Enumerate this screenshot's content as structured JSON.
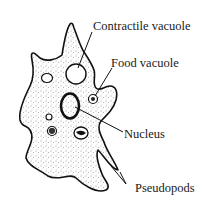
{
  "diagram": {
    "labels": {
      "contractile_vacuole": "Contractile vacuole",
      "food_vacuole": "Food vacuole",
      "nucleus": "Nucleus",
      "pseudopods": "Pseudopods"
    },
    "colors": {
      "outline": "#111111",
      "stipple": "#333333",
      "background": "#ffffff"
    }
  }
}
